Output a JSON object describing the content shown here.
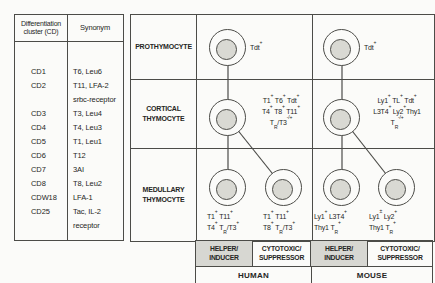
{
  "figure": {
    "colors": {
      "background": "#fbfbf9",
      "line": "#4c4c48",
      "cell_fill": "#d9d9d3",
      "shaded_box": "#d7d7d2",
      "text": "#262624"
    },
    "table": {
      "header_cd": "Differentiation\ncluster (CD)",
      "header_synonym": "Synonym",
      "rows": [
        {
          "cd": "CD1",
          "syn": "T6, Leu6"
        },
        {
          "cd": "CD2",
          "syn": "T11, LFA-2\nsrbc-receptor"
        },
        {
          "cd": "CD3",
          "syn": "T3, Leu4"
        },
        {
          "cd": "CD4",
          "syn": "T4, Leu3"
        },
        {
          "cd": "CD5",
          "syn": "T1, Leu1"
        },
        {
          "cd": "CD6",
          "syn": "T12"
        },
        {
          "cd": "CD7",
          "syn": "3AI"
        },
        {
          "cd": "CD8",
          "syn": "T8, Leu2"
        },
        {
          "cd": "CDW18",
          "syn": "LFA-1"
        },
        {
          "cd": "CD25",
          "syn": "Tac, IL-2\nreceptor"
        }
      ]
    },
    "diagram": {
      "stages": {
        "prothymocyte": "PROTHYMOCYTE",
        "cortical": "CORTICAL\nTHYMOCYTE",
        "medullary": "MEDULLARY\nTHYMOCYTE"
      },
      "human": {
        "prothymocyte_markers": "Tdt^{+}",
        "cortical_markers": [
          "T1^{+} T6^{+} Tdt^{+}",
          "T4^{+} T8^{+} T11^{+}",
          "T_{R}/T3^{-/+}"
        ],
        "medullary_helper_markers": [
          "T1^{+} T11^{+}",
          "T4^{+} T_{R}/T3^{+}"
        ],
        "medullary_cytotoxic_markers": [
          "T1^{+} T11^{+}",
          "T8^{+} T_{R}/T3^{+}"
        ],
        "label": "HUMAN"
      },
      "mouse": {
        "prothymocyte_markers": "Tdt^{+}",
        "cortical_markers": [
          "Ly1^{+} TL^{+} Tdt^{+}",
          "L3T4^{+} Ly2^{+}Thy1",
          "T_{R}^{-/+}"
        ],
        "medullary_helper_markers": [
          "Ly1^{+} L3T4^{+}",
          "Thy1 T_{R}^{+}"
        ],
        "medullary_cytotoxic_markers": [
          "Ly1^{±} Ly2^{+}",
          "Thy1 T_{R}^{+}"
        ],
        "label": "MOUSE"
      },
      "lineage_boxes": [
        "HELPER/\nINDUCER",
        "CYTOTOXIC/\nSUPPRESSOR",
        "HELPER/\nINDUCER",
        "CYTOTOXIC/\nSUPPRESSOR"
      ]
    }
  }
}
